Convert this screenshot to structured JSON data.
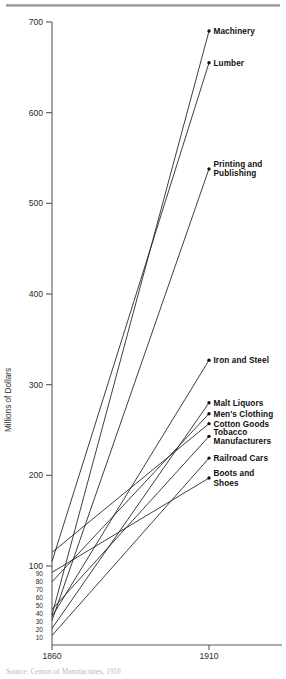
{
  "figure": {
    "top_rule": "horizontal-rule",
    "source_note": "Source: Census of Manufactures, 1910"
  },
  "chart_data": {
    "type": "line",
    "title": "",
    "subtitle": "",
    "xlabel": "",
    "ylabel": "Millions of Dollars",
    "x": [
      1860,
      1910
    ],
    "x_tick_labels": [
      "1860",
      "1910"
    ],
    "xlim": [
      1860,
      1910
    ],
    "ylim": [
      0,
      700
    ],
    "grid": false,
    "legend_position": "right-endpoint-labels",
    "y_ticks_major": [
      100,
      200,
      300,
      400,
      500,
      600,
      700
    ],
    "y_ticks_minor": [
      10,
      20,
      30,
      40,
      50,
      60,
      70,
      80,
      90
    ],
    "y_tick_labels_major": [
      "100",
      "200",
      "300",
      "400",
      "500",
      "600",
      "700"
    ],
    "y_tick_labels_minor": [
      "10",
      "20",
      "30",
      "40",
      "50",
      "60",
      "70",
      "80",
      "90"
    ],
    "axis_note": "Lower portion of the value axis (0-100) is drawn on an expanded scale.",
    "series": [
      {
        "name": "Machinery",
        "values": [
          38,
          690
        ]
      },
      {
        "name": "Lumber",
        "values": [
          105,
          655
        ]
      },
      {
        "name": "Printing and Publishing",
        "values": [
          31,
          538
        ]
      },
      {
        "name": "Iron and Steel",
        "values": [
          36,
          327
        ]
      },
      {
        "name": "Malt Liquors",
        "values": [
          21,
          280
        ]
      },
      {
        "name": "Men's Clothing",
        "values": [
          80,
          268
        ]
      },
      {
        "name": "Cotton Goods",
        "values": [
          115,
          257
        ]
      },
      {
        "name": "Tobacco Manufacturers",
        "values": [
          45,
          243
        ]
      },
      {
        "name": "Railroad Cars",
        "values": [
          12,
          219
        ]
      },
      {
        "name": "Boots and Shoes",
        "values": [
          92,
          197
        ]
      }
    ],
    "series_labels": [
      {
        "label": "Machinery",
        "lines": [
          "Machinery"
        ]
      },
      {
        "label": "Lumber",
        "lines": [
          "Lumber"
        ]
      },
      {
        "label": "Printing and Publishing",
        "lines": [
          "Printing and",
          "Publishing"
        ]
      },
      {
        "label": "Iron and Steel",
        "lines": [
          "Iron and Steel"
        ]
      },
      {
        "label": "Malt Liquors",
        "lines": [
          "Malt Liquors"
        ]
      },
      {
        "label": "Men's Clothing",
        "lines": [
          "Men's Clothing"
        ]
      },
      {
        "label": "Cotton Goods",
        "lines": [
          "Cotton Goods"
        ]
      },
      {
        "label": "Tobacco Manufacturers",
        "lines": [
          "Tobacco",
          "Manufacturers"
        ]
      },
      {
        "label": "Railroad Cars",
        "lines": [
          "Railroad Cars"
        ]
      },
      {
        "label": "Boots and Shoes",
        "lines": [
          "Boots and",
          "Shoes"
        ]
      }
    ]
  }
}
